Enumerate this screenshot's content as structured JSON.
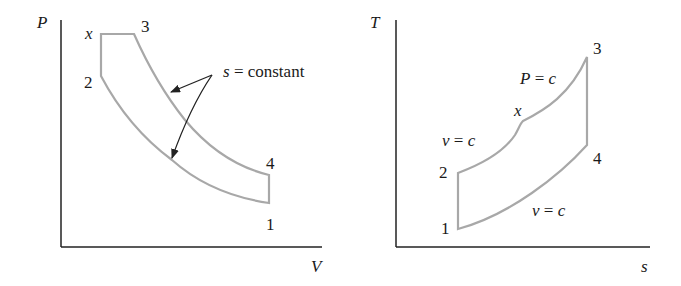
{
  "diagrams": [
    {
      "id": "pv",
      "x_axis_label": "V",
      "y_axis_label": "P",
      "state_labels": {
        "x": "x",
        "s3": "3",
        "s2": "2",
        "s4": "4",
        "s1": "1"
      },
      "annotation": {
        "var": "s",
        "text": "= constant"
      }
    },
    {
      "id": "ts",
      "x_axis_label": "s",
      "y_axis_label": "T",
      "state_labels": {
        "x": "x",
        "s3": "3",
        "s2": "2",
        "s4": "4",
        "s1": "1"
      },
      "annotations": {
        "p_const": {
          "var": "P",
          "eq": "=",
          "c": "c"
        },
        "v_const_upper": {
          "var": "v",
          "eq": "=",
          "c": "c"
        },
        "v_const_lower": {
          "var": "v",
          "eq": "=",
          "c": "c"
        }
      }
    }
  ],
  "colors": {
    "axis": "#222222",
    "cycle": "#a8a8a8",
    "arrow": "#222222"
  }
}
